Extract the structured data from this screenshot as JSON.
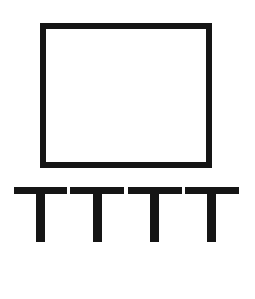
{
  "diagram": {
    "stroke_color": "#151515",
    "background": "#ffffff",
    "rectangle": {
      "x": 40,
      "y": 23,
      "width": 172,
      "height": 145,
      "stroke": 6
    },
    "t_shapes": [
      {
        "bar_x": 14,
        "bar_w": 53,
        "stem_x": 36,
        "stem_w": 9
      },
      {
        "bar_x": 70,
        "bar_w": 54,
        "stem_x": 93,
        "stem_w": 9
      },
      {
        "bar_x": 128,
        "bar_w": 54,
        "stem_x": 150,
        "stem_w": 9
      },
      {
        "bar_x": 185,
        "bar_w": 54,
        "stem_x": 207,
        "stem_w": 9
      }
    ],
    "t_bar_y": 187,
    "t_bar_h": 7,
    "t_stem_bottom": 242
  }
}
